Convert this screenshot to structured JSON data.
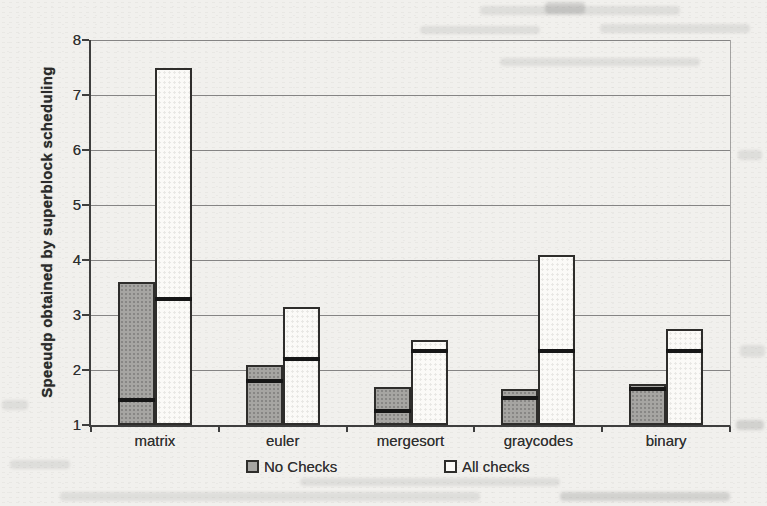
{
  "page": {
    "background": "#f1f0ed"
  },
  "chart_data": {
    "type": "bar",
    "title": "",
    "ylabel": "Speeudp obtained by superblock scheduling",
    "xlabel": "",
    "ylim": [
      1,
      8
    ],
    "ytick_labels": [
      "1",
      "2",
      "3",
      "4",
      "5",
      "6",
      "7",
      "8"
    ],
    "grid": true,
    "legend_position": "bottom",
    "categories": [
      "matrix",
      "euler",
      "mergesort",
      "graycodes",
      "binary"
    ],
    "series": [
      {
        "name": "No Checks",
        "color": "#a6a5a2",
        "values": [
          3.6,
          2.1,
          1.7,
          1.65,
          1.75
        ],
        "median_markers": [
          1.45,
          1.8,
          1.25,
          1.5,
          1.65
        ]
      },
      {
        "name": "All checks",
        "color": "#fbfaf7",
        "values": [
          7.5,
          3.15,
          2.55,
          4.1,
          2.75
        ],
        "median_markers": [
          3.3,
          2.2,
          2.35,
          2.35,
          2.35
        ]
      }
    ],
    "marker_color": "#161616",
    "bar_border_color": "#2e2d2b",
    "axis_color": "#3e3e3e"
  }
}
